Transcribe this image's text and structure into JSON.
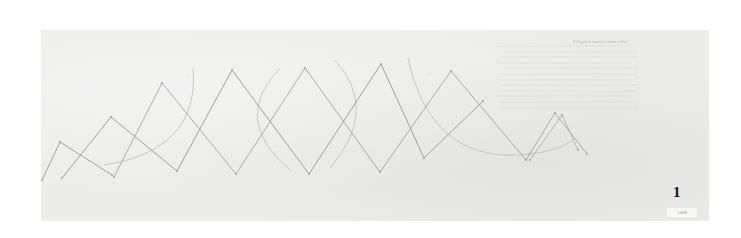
{
  "document": {
    "type": "historical pencil drawing",
    "plate_number": "1",
    "catalog_label": "12098",
    "colors": {
      "paper": "#ececeb",
      "pencil_dark": "#8c8c8c",
      "pencil_light": "#b9b9b9",
      "ink_number": "#111111"
    }
  },
  "notes": {
    "title": "[illegible handwritten title]",
    "lines": [
      "[illegible handwritten note line 1]",
      "[illegible handwritten note line 2]",
      "[illegible handwritten note line 3]",
      "[illegible handwritten note line 4]",
      "[illegible handwritten note line 5]",
      "[illegible handwritten note line 6]",
      "[illegible handwritten note line 7]",
      "[illegible handwritten note line 8]",
      "[illegible handwritten note line 9]",
      "[illegible handwritten note line 10]",
      "[illegible handwritten note line 11]",
      "[illegible handwritten note line 12]"
    ]
  },
  "drawing": {
    "zigzag_series": [
      {
        "name": "zigzag-a",
        "stroke": "#8f8f8f",
        "points": [
          [
            42,
            180
          ],
          [
            60,
            142
          ],
          [
            112,
            175
          ]
        ]
      },
      {
        "name": "zigzag-b",
        "stroke": "#8a8a8a",
        "points": [
          [
            62,
            178
          ],
          [
            111,
            117
          ],
          [
            177,
            171
          ],
          [
            232,
            70
          ],
          [
            309,
            174
          ],
          [
            381,
            64
          ],
          [
            424,
            158
          ],
          [
            483,
            101
          ]
        ]
      },
      {
        "name": "zigzag-c",
        "stroke": "#9a9a9a",
        "points": [
          [
            114,
            177
          ],
          [
            162,
            83
          ],
          [
            236,
            174
          ],
          [
            305,
            68
          ],
          [
            380,
            172
          ],
          [
            451,
            71
          ],
          [
            526,
            160
          ],
          [
            555,
            113
          ],
          [
            587,
            154
          ]
        ]
      },
      {
        "name": "zigzag-d",
        "stroke": "#a8a8a8",
        "points": [
          [
            530,
            160
          ],
          [
            562,
            115
          ],
          [
            578,
            150
          ]
        ]
      }
    ],
    "arcs": [
      {
        "name": "arc-left",
        "path": "M 104 165 Q 200 150 193 68"
      },
      {
        "name": "arc-middle-left",
        "path": "M 280 68 Q 230 120 290 170"
      },
      {
        "name": "arc-middle-right",
        "path": "M 335 60 Q 380 110 330 168"
      },
      {
        "name": "arc-right",
        "path": "M 408 58 Q 430 160 520 155 Q 560 152 575 138"
      }
    ],
    "arc_labels": [
      {
        "x": 185,
        "y": 78,
        "text": "[illegible]"
      },
      {
        "x": 272,
        "y": 72,
        "text": "[illegible]"
      },
      {
        "x": 426,
        "y": 76,
        "text": "[illegible]"
      }
    ]
  }
}
